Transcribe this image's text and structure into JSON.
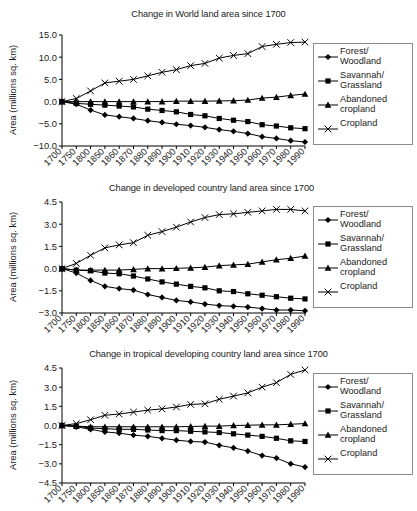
{
  "figure": {
    "y_axis_label": "Area (millions sq. km)",
    "legend": [
      {
        "label": "Forest/\nWoodland",
        "marker": "diamond"
      },
      {
        "label": "Savannah/\nGrassland",
        "marker": "square"
      },
      {
        "label": "Abandoned\ncropland",
        "marker": "triangle"
      },
      {
        "label": "Cropland",
        "marker": "x"
      }
    ],
    "line_color": "#000000",
    "legend_border_color": "#8a8a8a"
  },
  "chart_data": [
    {
      "type": "line",
      "title": "Change in World land area since 1700",
      "xlabel": "",
      "ylabel": "Area (millions sq. km)",
      "categories": [
        "1700",
        "1750",
        "1800",
        "1850",
        "1860",
        "1870",
        "1880",
        "1890",
        "1900",
        "1910",
        "1920",
        "1930",
        "1940",
        "1950",
        "1960",
        "1970",
        "1980",
        "1990"
      ],
      "ylim": [
        -10.0,
        15.0
      ],
      "yticks": [
        "15.0",
        "10.0",
        "5.0",
        "0.0",
        "-5.0",
        "-10.0"
      ],
      "grid": false,
      "legend_position": "right",
      "series": [
        {
          "name": "Forest/Woodland",
          "marker": "diamond",
          "values": [
            0.0,
            -0.6,
            -1.9,
            -3.0,
            -3.4,
            -3.8,
            -4.3,
            -4.7,
            -5.1,
            -5.4,
            -5.8,
            -6.3,
            -6.7,
            -7.2,
            -7.9,
            -8.3,
            -8.8,
            -9.1
          ]
        },
        {
          "name": "Savannah/Grassland",
          "marker": "square",
          "values": [
            0.0,
            -0.4,
            -0.6,
            -0.8,
            -1.0,
            -1.2,
            -1.7,
            -2.0,
            -2.3,
            -2.9,
            -3.2,
            -3.8,
            -4.2,
            -4.5,
            -5.2,
            -5.5,
            -5.9,
            -6.1
          ]
        },
        {
          "name": "Abandoned cropland",
          "marker": "triangle",
          "values": [
            0.0,
            0.0,
            0.0,
            0.0,
            0.0,
            0.0,
            0.0,
            0.0,
            0.1,
            0.1,
            0.1,
            0.15,
            0.2,
            0.35,
            0.8,
            1.0,
            1.4,
            1.7
          ]
        },
        {
          "name": "Cropland",
          "marker": "x",
          "values": [
            0.0,
            0.7,
            2.4,
            4.2,
            4.6,
            5.0,
            5.8,
            6.6,
            7.2,
            8.1,
            8.6,
            9.8,
            10.4,
            10.8,
            12.4,
            12.9,
            13.3,
            13.4
          ]
        }
      ]
    },
    {
      "type": "line",
      "title": "Change in developed country land area since 1700",
      "xlabel": "",
      "ylabel": "Area (millions sq. km)",
      "categories": [
        "1700",
        "1750",
        "1800",
        "1850",
        "1860",
        "1870",
        "1880",
        "1890",
        "1900",
        "1910",
        "1920",
        "1930",
        "1940",
        "1950",
        "1960",
        "1970",
        "1980",
        "1990"
      ],
      "ylim": [
        -3.0,
        4.5
      ],
      "yticks": [
        "4.5",
        "3.0",
        "1.5",
        "0.0",
        "-1.5",
        "-3.0"
      ],
      "grid": false,
      "legend_position": "right",
      "series": [
        {
          "name": "Forest/Woodland",
          "marker": "diamond",
          "values": [
            0.0,
            -0.3,
            -0.8,
            -1.2,
            -1.35,
            -1.45,
            -1.75,
            -1.95,
            -2.15,
            -2.25,
            -2.4,
            -2.5,
            -2.55,
            -2.6,
            -2.7,
            -2.8,
            -2.8,
            -2.85
          ]
        },
        {
          "name": "Savannah/Grassland",
          "marker": "square",
          "values": [
            0.0,
            -0.1,
            -0.15,
            -0.3,
            -0.35,
            -0.5,
            -0.7,
            -0.9,
            -1.05,
            -1.2,
            -1.3,
            -1.5,
            -1.55,
            -1.7,
            -1.8,
            -1.9,
            -2.0,
            -2.05
          ]
        },
        {
          "name": "Abandoned cropland",
          "marker": "triangle",
          "values": [
            0.0,
            -0.1,
            -0.1,
            -0.1,
            -0.1,
            -0.05,
            0.0,
            0.0,
            0.02,
            0.05,
            0.1,
            0.2,
            0.25,
            0.3,
            0.45,
            0.6,
            0.7,
            0.85
          ]
        },
        {
          "name": "Cropland",
          "marker": "x",
          "values": [
            0.0,
            0.35,
            0.9,
            1.4,
            1.6,
            1.75,
            2.25,
            2.5,
            2.8,
            3.15,
            3.45,
            3.65,
            3.7,
            3.8,
            3.9,
            4.0,
            4.0,
            3.9
          ]
        }
      ]
    },
    {
      "type": "line",
      "title": "Change in tropical developing country land area since 1700",
      "xlabel": "",
      "ylabel": "Area (millions sq. km)",
      "categories": [
        "1700",
        "1750",
        "1800",
        "1850",
        "1860",
        "1870",
        "1880",
        "1890",
        "1900",
        "1910",
        "1920",
        "1930",
        "1940",
        "1950",
        "1960",
        "1970",
        "1980",
        "1990"
      ],
      "ylim": [
        -4.5,
        4.5
      ],
      "yticks": [
        "4.5",
        "3.0",
        "1.5",
        "0.0",
        "-1.5",
        "-3.0",
        "-4.5"
      ],
      "grid": false,
      "legend_position": "right",
      "series": [
        {
          "name": "Forest/Woodland",
          "marker": "diamond",
          "values": [
            0.0,
            -0.1,
            -0.3,
            -0.5,
            -0.6,
            -0.75,
            -0.85,
            -1.0,
            -1.15,
            -1.25,
            -1.3,
            -1.55,
            -1.75,
            -2.0,
            -2.35,
            -2.55,
            -3.0,
            -3.25
          ]
        },
        {
          "name": "Savannah/Grassland",
          "marker": "square",
          "values": [
            0.0,
            -0.05,
            -0.2,
            -0.25,
            -0.3,
            -0.3,
            -0.35,
            -0.4,
            -0.4,
            -0.45,
            -0.5,
            -0.55,
            -0.65,
            -0.75,
            -0.85,
            -1.0,
            -1.2,
            -1.25
          ]
        },
        {
          "name": "Abandoned cropland",
          "marker": "triangle",
          "values": [
            0.0,
            -0.05,
            -0.1,
            -0.1,
            -0.1,
            -0.1,
            -0.1,
            -0.1,
            -0.1,
            -0.08,
            -0.05,
            -0.05,
            0.0,
            0.02,
            0.05,
            0.05,
            0.1,
            0.15
          ]
        },
        {
          "name": "Cropland",
          "marker": "x",
          "values": [
            0.0,
            0.15,
            0.45,
            0.8,
            0.9,
            1.05,
            1.2,
            1.3,
            1.45,
            1.65,
            1.7,
            2.05,
            2.3,
            2.55,
            3.0,
            3.35,
            4.0,
            4.35
          ]
        }
      ]
    }
  ]
}
